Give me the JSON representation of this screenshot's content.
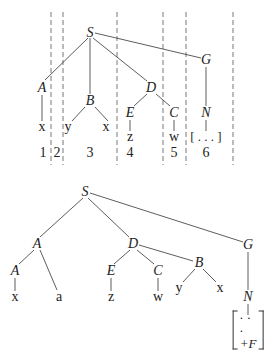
{
  "top_tree": {
    "nodes": {
      "S": {
        "label": "S",
        "x": 90,
        "y": 33
      },
      "A": {
        "label": "A",
        "x": 42,
        "y": 88
      },
      "B": {
        "label": "B",
        "x": 90,
        "y": 101
      },
      "D": {
        "label": "D",
        "x": 151,
        "y": 88
      },
      "G": {
        "label": "G",
        "x": 206,
        "y": 60
      },
      "E": {
        "label": "E",
        "x": 130,
        "y": 113
      },
      "C": {
        "label": "C",
        "x": 174,
        "y": 113
      },
      "N": {
        "label": "N",
        "x": 206,
        "y": 113
      }
    },
    "leaves": [
      {
        "label": "x",
        "x": 42,
        "y": 128
      },
      {
        "label": "y",
        "x": 68,
        "y": 128
      },
      {
        "label": "x",
        "x": 106,
        "y": 128
      },
      {
        "label": "z",
        "x": 130,
        "y": 137
      },
      {
        "label": "w",
        "x": 174,
        "y": 137
      },
      {
        "label": "[ . . . ]",
        "x": 206,
        "y": 137
      }
    ],
    "segment_numbers": [
      {
        "label": "1",
        "x": 43,
        "y": 153
      },
      {
        "label": "2",
        "x": 57,
        "y": 153
      },
      {
        "label": "3",
        "x": 90,
        "y": 153
      },
      {
        "label": "4",
        "x": 130,
        "y": 153
      },
      {
        "label": "5",
        "x": 174,
        "y": 153
      },
      {
        "label": "6",
        "x": 206,
        "y": 153
      }
    ],
    "dashed_dividers_x": [
      51,
      63,
      117,
      163,
      186,
      233
    ]
  },
  "bottom_tree": {
    "nodes": {
      "S": {
        "label": "S",
        "x": 85,
        "y": 192
      },
      "A1": {
        "label": "A",
        "x": 37,
        "y": 244
      },
      "D": {
        "label": "D",
        "x": 133,
        "y": 244
      },
      "G": {
        "label": "G",
        "x": 248,
        "y": 245
      },
      "A2": {
        "label": "A",
        "x": 15,
        "y": 271
      },
      "E": {
        "label": "E",
        "x": 111,
        "y": 271
      },
      "C": {
        "label": "C",
        "x": 158,
        "y": 271
      },
      "B": {
        "label": "B",
        "x": 199,
        "y": 263
      },
      "N": {
        "label": "N",
        "x": 248,
        "y": 297
      }
    },
    "leaves": [
      {
        "label": "x",
        "x": 15,
        "y": 297
      },
      {
        "label": "a",
        "x": 59,
        "y": 297
      },
      {
        "label": "z",
        "x": 111,
        "y": 297
      },
      {
        "label": "w",
        "x": 158,
        "y": 297
      },
      {
        "label": "y",
        "x": 179,
        "y": 288
      },
      {
        "label": "x",
        "x": 220,
        "y": 288
      }
    ],
    "bracket": {
      "top": "· · ·",
      "bottom": "+F",
      "x": 248,
      "y": 330
    }
  }
}
